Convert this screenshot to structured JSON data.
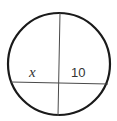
{
  "diagram": {
    "type": "intersecting-chords-circle",
    "circle": {
      "cx": 59,
      "cy": 64,
      "r": 51,
      "stroke": "#1a1a1a"
    },
    "chords": [
      {
        "name": "vertical-chord",
        "x1": 60,
        "y1": 13,
        "x2": 58,
        "y2": 116
      },
      {
        "name": "horizontal-chord",
        "x1": 11,
        "y1": 82,
        "x2": 108,
        "y2": 84
      }
    ],
    "labels": {
      "left_segment": "x",
      "right_segment": "10"
    }
  }
}
